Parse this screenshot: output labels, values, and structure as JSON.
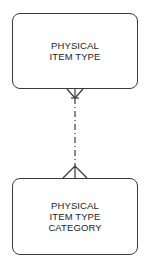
{
  "diagram": {
    "type": "entity-relationship",
    "entities": [
      {
        "id": "physical-item-type",
        "label": "PHYSICAL\nITEM TYPE"
      },
      {
        "id": "physical-item-type-category",
        "label": "PHYSICAL\nITEM TYPE\nCATEGORY"
      }
    ],
    "relationships": [
      {
        "from": "physical-item-type",
        "to": "physical-item-type-category",
        "from_end": "crows-foot-many",
        "to_end": "crows-foot-many",
        "line_style": "dash-dot"
      }
    ],
    "colors": {
      "stroke": "#3a3a3a",
      "background": "#ffffff",
      "text": "#222222"
    }
  }
}
